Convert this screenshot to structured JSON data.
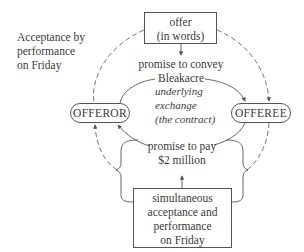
{
  "side_label": {
    "lines": [
      "Acceptance by",
      "performance",
      "on Friday"
    ]
  },
  "offer_box": {
    "lines": [
      "offer",
      "(in words)"
    ]
  },
  "promise_convey": {
    "lines": [
      "promise to convey",
      "Bleakacre"
    ]
  },
  "underlying": {
    "lines": [
      "underlying",
      "exchange",
      "(the contract)"
    ]
  },
  "promise_pay": {
    "lines": [
      "promise to pay",
      "$2 million"
    ]
  },
  "acceptance_box": {
    "lines": [
      "simultaneous",
      "acceptance and",
      "performance",
      "on Friday"
    ]
  },
  "parties": {
    "offeror": "OFFEROR",
    "offeree": "OFFEREE"
  },
  "colors": {
    "line": "#555555",
    "text": "#3a3a3a"
  }
}
